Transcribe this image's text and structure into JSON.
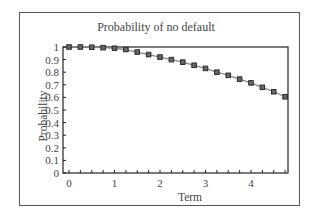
{
  "chart_data": {
    "type": "line",
    "title": "Probability of no default",
    "xlabel": "Term",
    "ylabel": "Probability",
    "xlim": [
      0,
      4.8
    ],
    "ylim": [
      0,
      1
    ],
    "x_ticks": [
      "0",
      "1",
      "2",
      "3",
      "4"
    ],
    "y_ticks": [
      "0",
      "0.1",
      "0.2",
      "0.3",
      "0.4",
      "0.5",
      "0.6",
      "0.7",
      "0.8",
      "0.9",
      "1"
    ],
    "grid": false,
    "legend": null,
    "series": [
      {
        "name": "Probability of no default",
        "marker": "square",
        "x": [
          0,
          0.25,
          0.5,
          0.75,
          1,
          1.25,
          1.5,
          1.75,
          2,
          2.25,
          2.5,
          2.75,
          3,
          3.25,
          3.5,
          3.75,
          4,
          4.25,
          4.5,
          4.75
        ],
        "values": [
          1.0,
          1.0,
          0.998,
          0.995,
          0.99,
          0.98,
          0.96,
          0.94,
          0.92,
          0.9,
          0.88,
          0.855,
          0.83,
          0.8,
          0.775,
          0.745,
          0.715,
          0.68,
          0.645,
          0.605
        ]
      }
    ]
  }
}
